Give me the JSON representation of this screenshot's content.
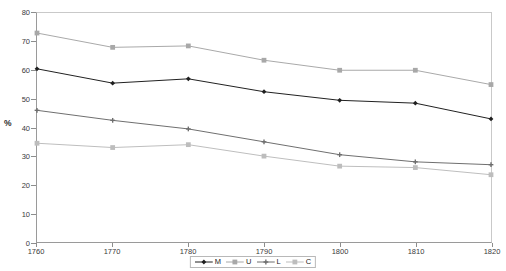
{
  "chart_data": {
    "type": "line",
    "title": "",
    "xlabel": "",
    "ylabel": "%",
    "x": [
      1760,
      1770,
      1780,
      1790,
      1800,
      1810,
      1820
    ],
    "xlim": [
      1760,
      1820
    ],
    "ylim": [
      0,
      80
    ],
    "xticks": [
      "1760",
      "1770",
      "1780",
      "1790",
      "1800",
      "1810",
      "1820"
    ],
    "yticks": [
      "0",
      "10",
      "20",
      "30",
      "40",
      "50",
      "60",
      "70",
      "80"
    ],
    "grid": false,
    "legend_position": "bottom-center",
    "series": [
      {
        "name": "M",
        "marker": "diamond",
        "color": "#1f1f1f",
        "values": [
          60.5,
          55.5,
          57.0,
          52.5,
          49.5,
          48.5,
          43.0
        ]
      },
      {
        "name": "U",
        "marker": "square",
        "color": "#a8a8a8",
        "values": [
          73.0,
          68.0,
          68.5,
          63.5,
          60.0,
          60.0,
          55.0
        ]
      },
      {
        "name": "L",
        "marker": "cross",
        "color": "#6e6e6e",
        "values": [
          46.0,
          42.5,
          39.5,
          35.0,
          30.5,
          28.0,
          27.0
        ]
      },
      {
        "name": "C",
        "marker": "square",
        "color": "#bdbdbd",
        "values": [
          34.5,
          33.0,
          34.0,
          30.0,
          26.5,
          26.0,
          23.5
        ]
      }
    ]
  },
  "legend": {
    "items": [
      {
        "label": "M"
      },
      {
        "label": "U"
      },
      {
        "label": "L"
      },
      {
        "label": "C"
      }
    ]
  }
}
